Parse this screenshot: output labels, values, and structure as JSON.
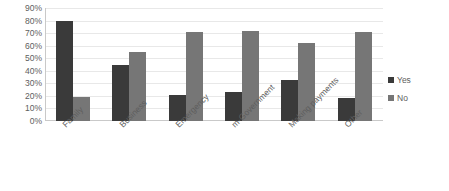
{
  "chart_data": {
    "type": "bar",
    "title": "",
    "xlabel": "",
    "ylabel": "",
    "ylim": [
      0,
      90
    ],
    "ytick_step": 10,
    "grid": true,
    "legend_position": "right",
    "categories": [
      "Family",
      "Business",
      "Emergency",
      "m-Government",
      "Making payments",
      "Other"
    ],
    "ytick_labels": [
      "90%",
      "80%",
      "70%",
      "60%",
      "50%",
      "40%",
      "30%",
      "20%",
      "10%",
      "0%"
    ],
    "ytick_values": [
      90,
      80,
      70,
      60,
      50,
      40,
      30,
      20,
      10,
      0
    ],
    "series": [
      {
        "name": "Yes",
        "color": "#3a3a3a",
        "values": [
          80,
          45,
          21,
          23,
          33,
          18
        ]
      },
      {
        "name": "No",
        "color": "#767676",
        "values": [
          19,
          55,
          71,
          72,
          62,
          71
        ]
      }
    ]
  },
  "legend": {
    "items": [
      {
        "label": "Yes",
        "color": "#3a3a3a"
      },
      {
        "label": "No",
        "color": "#767676"
      }
    ]
  },
  "colors": {
    "background": "#ffffff",
    "gridline": "#e8e8e8",
    "axis": "#c9c9c9",
    "text": "#5e5e5e"
  }
}
